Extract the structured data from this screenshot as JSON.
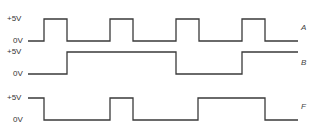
{
  "diagram": {
    "type": "timing-diagram",
    "signals": [
      {
        "name": "A",
        "high_label": "+5V",
        "low_label": "0V",
        "levels": "0,1,0,1,0,1,0,1,0",
        "edges_x": [
          28,
          44,
          67,
          110,
          133,
          176,
          199,
          242,
          265,
          298
        ]
      },
      {
        "name": "B",
        "high_label": "+5V",
        "low_label": "0V",
        "levels": "0,1,0,1",
        "edges_x": [
          28,
          67,
          176,
          242,
          298
        ]
      },
      {
        "name": "F",
        "high_label": "+5V",
        "low_label": "0V",
        "levels": "1,0,1,0,1,0",
        "edges_x": [
          28,
          44,
          110,
          133,
          198,
          265,
          298
        ]
      }
    ]
  },
  "labels": {
    "a_high": "+5V",
    "a_low": "0V",
    "a_name": "A",
    "b_high": "+5V",
    "b_low": "0V",
    "b_name": "B",
    "f_high": "+5V",
    "f_low": "0V",
    "f_name": "F"
  }
}
